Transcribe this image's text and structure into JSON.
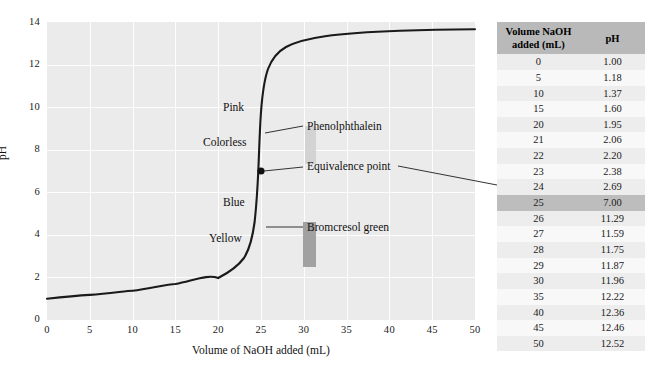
{
  "chart_data": {
    "type": "line",
    "title": "",
    "xlabel": "Volume of NaOH added (mL)",
    "ylabel": "pH",
    "xlim": [
      0,
      50
    ],
    "ylim": [
      0,
      14
    ],
    "xticks": [
      0,
      5,
      10,
      15,
      20,
      25,
      30,
      35,
      40,
      45,
      50
    ],
    "yticks": [
      0,
      2,
      4,
      6,
      8,
      10,
      12,
      14
    ],
    "grid": true,
    "legend": "none",
    "x": [
      0,
      5,
      10,
      15,
      20,
      21,
      22,
      23,
      24,
      25,
      26,
      27,
      28,
      29,
      30,
      35,
      40,
      45,
      50
    ],
    "y": [
      1.0,
      1.18,
      1.37,
      1.6,
      1.95,
      2.06,
      2.2,
      2.38,
      2.69,
      7.0,
      11.29,
      11.59,
      11.75,
      11.87,
      11.96,
      12.22,
      12.36,
      12.46,
      12.52
    ],
    "series": [
      {
        "name": "Titration of strong acid with NaOH",
        "values": [
          1.0,
          1.18,
          1.37,
          1.6,
          1.95,
          2.06,
          2.2,
          2.38,
          2.69,
          7.0,
          11.29,
          11.59,
          11.75,
          11.87,
          11.96,
          12.22,
          12.36,
          12.46,
          12.52
        ]
      }
    ],
    "annotations": [
      {
        "name": "equivalence-point",
        "label": "Equivalence point",
        "x": 25,
        "y": 7.0
      },
      {
        "name": "phenolphthalein-band",
        "label": "Phenolphthalein",
        "range_ph": [
          8.2,
          10.0
        ],
        "colors": [
          "Colorless",
          "Pink"
        ]
      },
      {
        "name": "bromcresol-green-band",
        "label": "Bromcresol green",
        "range_ph": [
          3.8,
          5.4
        ],
        "colors": [
          "Yellow",
          "Blue"
        ]
      }
    ]
  },
  "axes": {
    "y_title": "pH",
    "x_title": "Volume of NaOH added (mL)",
    "y_labels": [
      "14",
      "12",
      "10",
      "8",
      "6",
      "4",
      "2",
      "0"
    ],
    "x_labels": [
      "0",
      "5",
      "10",
      "15",
      "20",
      "25",
      "30",
      "35",
      "40",
      "45",
      "50"
    ]
  },
  "annotations": {
    "pink": "Pink",
    "colorless": "Colorless",
    "blue": "Blue",
    "yellow": "Yellow",
    "phenolphthalein": "Phenolphthalein",
    "equivalence_point": "Equivalence point",
    "bromcresol_green": "Bromcresol green"
  },
  "table": {
    "headers": [
      "Volume NaOH\nadded (mL)",
      "pH"
    ],
    "header_volume_line1": "Volume NaOH",
    "header_volume_line2": "added (mL)",
    "header_ph": "pH",
    "highlight_row_index": 9,
    "rows": [
      {
        "volume": "0",
        "ph": "1.00"
      },
      {
        "volume": "5",
        "ph": "1.18"
      },
      {
        "volume": "10",
        "ph": "1.37"
      },
      {
        "volume": "15",
        "ph": "1.60"
      },
      {
        "volume": "20",
        "ph": "1.95"
      },
      {
        "volume": "21",
        "ph": "2.06"
      },
      {
        "volume": "22",
        "ph": "2.20"
      },
      {
        "volume": "23",
        "ph": "2.38"
      },
      {
        "volume": "24",
        "ph": "2.69"
      },
      {
        "volume": "25",
        "ph": "7.00"
      },
      {
        "volume": "26",
        "ph": "11.29"
      },
      {
        "volume": "27",
        "ph": "11.59"
      },
      {
        "volume": "28",
        "ph": "11.75"
      },
      {
        "volume": "29",
        "ph": "11.87"
      },
      {
        "volume": "30",
        "ph": "11.96"
      },
      {
        "volume": "35",
        "ph": "12.22"
      },
      {
        "volume": "40",
        "ph": "12.36"
      },
      {
        "volume": "45",
        "ph": "12.46"
      },
      {
        "volume": "50",
        "ph": "12.52"
      }
    ]
  },
  "colors": {
    "plot_background": "#ebebeb",
    "gridline": "#fdfdfd",
    "curve": "#1a1a1a",
    "phenolphthalein_band": "#cfcfcf",
    "bromcresol_band": "#9a9a9a",
    "table_header": "#b9b9b9",
    "table_highlight": "#bdbdbd"
  }
}
